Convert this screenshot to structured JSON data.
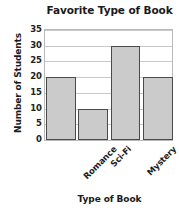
{
  "chart_data": {
    "type": "bar",
    "title": "Favorite Type of Book",
    "xlabel": "Type of Book",
    "ylabel": "Number of Students",
    "categories": [
      "Romance",
      "Sci-Fi",
      "Mystery",
      "Adventure"
    ],
    "values": [
      20,
      10,
      30,
      20
    ],
    "ylim": [
      0,
      35
    ],
    "ytick_labels": [
      "35",
      "30",
      "25",
      "20",
      "15",
      "10",
      "5",
      "0"
    ],
    "ytick_values": [
      35,
      30,
      25,
      20,
      15,
      10,
      5,
      0
    ],
    "ytick_step": 5,
    "grid": true,
    "legend": "none",
    "bar_fill_color": "#cbcbcb",
    "bar_border_color": "#4a4a4a",
    "gridline_color": "#c9c9c9",
    "plot_border_color": "#b9b9b9",
    "text_color": "#1a1a1a",
    "background_color": "#ffffff",
    "xtick_label_rotation": -45
  }
}
